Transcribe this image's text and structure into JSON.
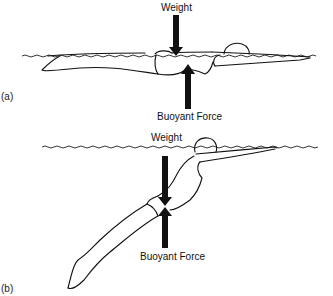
{
  "figure": {
    "panels": [
      {
        "id": "a",
        "label": "(a)",
        "posture": "horizontal",
        "forces": {
          "weight_label": "Weight",
          "buoyant_label": "Buoyant Force"
        },
        "note": "Weight and buoyant force nearly aligned"
      },
      {
        "id": "b",
        "label": "(b)",
        "posture": "inclined, legs sinking",
        "forces": {
          "weight_label": "Weight",
          "buoyant_label": "Buoyant Force"
        }
      }
    ],
    "colors": {
      "ink": "#111111",
      "background": "#ffffff"
    }
  }
}
